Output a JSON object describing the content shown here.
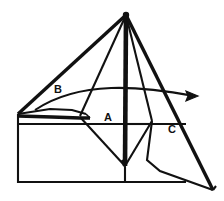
{
  "figure": {
    "type": "line-diagram",
    "title": "",
    "background_color": "#ffffff",
    "ink_color": "#111111",
    "canvas": {
      "width": 224,
      "height": 201
    },
    "labels": [
      {
        "id": "B",
        "text": "B",
        "x": 58,
        "y": 90
      },
      {
        "id": "A",
        "text": "A",
        "x": 108,
        "y": 118
      },
      {
        "id": "C",
        "text": "C",
        "x": 172,
        "y": 130
      }
    ],
    "annotations": {
      "apex_label": "apex",
      "baseline_label": "baseline",
      "arrow_label": "direction-arrow"
    },
    "geometry": {
      "apex": {
        "x": 126,
        "y": 15
      },
      "left_vertex": {
        "x": 18,
        "y": 114
      },
      "arrow_tip": {
        "x": 198,
        "y": 96
      },
      "rays": [
        {
          "id": "ray-left",
          "from": [
            126,
            15
          ],
          "to": [
            18,
            114
          ]
        },
        {
          "id": "ray-a-left",
          "from": [
            126,
            15
          ],
          "to": [
            80,
            116
          ]
        },
        {
          "id": "ray-center",
          "from": [
            126,
            15
          ],
          "to": [
            125,
            168
          ]
        },
        {
          "id": "ray-c-inner",
          "from": [
            126,
            15
          ],
          "to": [
            152,
            121
          ]
        },
        {
          "id": "ray-right",
          "from": [
            126,
            15
          ],
          "to": [
            213,
            190
          ]
        }
      ],
      "base_rectangle": {
        "left": 18,
        "right": 186,
        "top": 124,
        "bottom": 182
      },
      "sliver_top": [
        [
          18,
          114
        ],
        [
          55,
          110
        ],
        [
          85,
          113
        ],
        [
          80,
          117
        ],
        [
          45,
          118
        ]
      ],
      "curve": {
        "start": [
          35,
          110
        ],
        "control1": [
          95,
          84
        ],
        "control2": [
          150,
          90
        ],
        "end": [
          196,
          96
        ]
      },
      "region_a_polygon": [
        [
          80,
          116
        ],
        [
          104,
          112
        ],
        [
          152,
          121
        ],
        [
          125,
          168
        ]
      ],
      "region_c_polygon": [
        [
          152,
          121
        ],
        [
          213,
          190
        ],
        [
          160,
          170
        ],
        [
          148,
          160
        ]
      ],
      "horizontal_tick": {
        "from": [
          125,
          124
        ],
        "to": [
          152,
          124
        ]
      }
    }
  }
}
